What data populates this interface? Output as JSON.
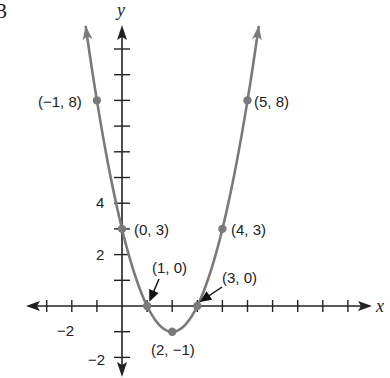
{
  "figure_number": "3",
  "colors": {
    "curve": "#7a7a7a",
    "axes": "#222222",
    "points": "#7a7a7a",
    "background": "#ffffff"
  },
  "chart_data": {
    "type": "line",
    "title": "",
    "function": "y = x^2 - 4x + 3",
    "xlabel": "x",
    "ylabel": "y",
    "xlim": [
      -3.6,
      10
    ],
    "ylim": [
      -2.7,
      11
    ],
    "grid": false,
    "legend": null,
    "x_tick_labels": [
      {
        "value": -2,
        "label": "−2"
      }
    ],
    "y_tick_labels": [
      {
        "value": 4,
        "label": "4"
      },
      {
        "value": 2,
        "label": "2"
      },
      {
        "value": -2,
        "label": "−2"
      }
    ],
    "x_ticks": [
      -3,
      -2,
      -1,
      1,
      2,
      3,
      4,
      5,
      6,
      7,
      8,
      9
    ],
    "y_ticks": [
      -2,
      -1,
      1,
      2,
      3,
      4,
      5,
      6,
      7,
      8,
      9,
      10
    ],
    "points": [
      {
        "x": -1,
        "y": 8,
        "label": "(−1, 8)"
      },
      {
        "x": 5,
        "y": 8,
        "label": "(5, 8)"
      },
      {
        "x": 0,
        "y": 3,
        "label": "(0, 3)"
      },
      {
        "x": 4,
        "y": 3,
        "label": "(4, 3)"
      },
      {
        "x": 1,
        "y": 0,
        "label": "(1, 0)",
        "arrow": true
      },
      {
        "x": 3,
        "y": 0,
        "label": "(3, 0)",
        "arrow": true
      },
      {
        "x": 2,
        "y": -1,
        "label": "(2, −1)"
      }
    ],
    "curve_domain": [
      -1.45,
      5.45
    ]
  }
}
